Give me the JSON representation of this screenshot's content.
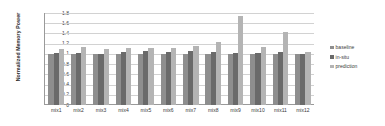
{
  "chart_data": {
    "type": "bar",
    "title": "",
    "xlabel": "",
    "ylabel": "Normalized Memory Power",
    "ylim": [
      0,
      1.8
    ],
    "yticks": [
      "0",
      "0.2",
      "0.4",
      "0.6",
      "0.8",
      "1",
      "1.2",
      "1.4",
      "1.6",
      "1.8"
    ],
    "grid": true,
    "legend_position": "right",
    "categories": [
      "mix1",
      "mix2",
      "mix3",
      "mix4",
      "mix5",
      "mix6",
      "mix7",
      "mix8",
      "mix9",
      "mix10",
      "mix11",
      "mix12"
    ],
    "series": [
      {
        "name": "baseline",
        "color": "#8e8e8e",
        "values": [
          1.0,
          1.0,
          1.0,
          1.0,
          1.0,
          1.0,
          1.0,
          1.0,
          1.0,
          1.0,
          1.0,
          1.0
        ]
      },
      {
        "name": "in-situ",
        "color": "#6a6a6a",
        "values": [
          1.02,
          1.02,
          1.0,
          1.04,
          1.06,
          1.03,
          1.05,
          1.03,
          1.02,
          1.01,
          1.03,
          1.0
        ]
      },
      {
        "name": "prediction",
        "color": "#b4b4b4",
        "values": [
          1.09,
          1.13,
          1.1,
          1.11,
          1.12,
          1.11,
          1.15,
          1.24,
          1.74,
          1.13,
          1.42,
          1.03
        ]
      }
    ]
  },
  "legend": {
    "items": [
      {
        "label": "baseline",
        "key": "baseline"
      },
      {
        "label": "in-situ",
        "key": "insitu"
      },
      {
        "label": "prediction",
        "key": "prediction"
      }
    ]
  }
}
